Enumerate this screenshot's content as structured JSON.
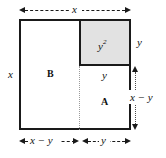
{
  "figure": {
    "colors": {
      "stroke": "#1a1a1a",
      "shade_fill": "#e2e2e2",
      "guide": "#9a9a9a",
      "background": "#ffffff"
    },
    "regions": [
      {
        "id": "B",
        "label": "B",
        "shaded": false
      },
      {
        "id": "A",
        "label": "A",
        "shaded": false
      },
      {
        "id": "sq",
        "label": "y2",
        "label_base": "y",
        "label_exp": "2",
        "shaded": true
      }
    ],
    "labels": {
      "top_x": "x",
      "left_x": "x",
      "right_y": "y",
      "right_x_minus_y": "x − y",
      "inner_y": "y",
      "square": "y",
      "square_exponent": "2",
      "region_b": "B",
      "region_a": "A",
      "bottom_x_minus_y": "x − y",
      "bottom_y": "y"
    },
    "dimensions": {
      "outer_width": "x",
      "outer_height": "x",
      "square_side": "y",
      "remainder": "x − y"
    }
  }
}
